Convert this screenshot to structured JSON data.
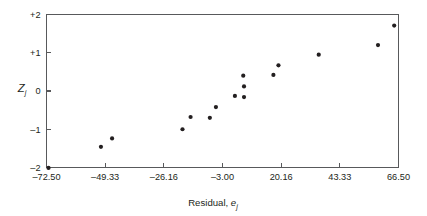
{
  "chart_data": {
    "type": "scatter",
    "title": "",
    "subtitle": "",
    "xlabel": "Residual, e",
    "xlabel_sub": "j",
    "ylabel": "Z",
    "ylabel_sub": "j",
    "xlim": [
      -72.5,
      66.5
    ],
    "ylim": [
      -2,
      2
    ],
    "grid": false,
    "legend": null,
    "xticks": [
      -72.5,
      -49.33,
      -26.16,
      -3.0,
      20.16,
      43.33,
      66.5
    ],
    "xtick_labels": [
      "–72.50",
      "–49.33",
      "–26.16",
      "–3.00",
      "20.16",
      "43.33",
      "66.50"
    ],
    "yticks": [
      2,
      1,
      0,
      -1,
      -2
    ],
    "ytick_labels": [
      "+2",
      "+1",
      "0",
      "–1",
      "–2"
    ],
    "marker": "filled-circle",
    "marker_color": "#231f20",
    "marker_size_px": 4.2,
    "points": [
      {
        "x": -71.7,
        "y": -2.01
      },
      {
        "x": -51.0,
        "y": -1.46
      },
      {
        "x": -46.6,
        "y": -1.24
      },
      {
        "x": -18.8,
        "y": -1.0
      },
      {
        "x": -15.6,
        "y": -0.68
      },
      {
        "x": -8.0,
        "y": -0.7
      },
      {
        "x": -5.6,
        "y": -0.42
      },
      {
        "x": 1.9,
        "y": -0.13
      },
      {
        "x": 5.5,
        "y": -0.16
      },
      {
        "x": 5.5,
        "y": 0.12
      },
      {
        "x": 5.2,
        "y": 0.4
      },
      {
        "x": 17.1,
        "y": 0.42
      },
      {
        "x": 19.1,
        "y": 0.67
      },
      {
        "x": 35.0,
        "y": 0.95
      },
      {
        "x": 58.4,
        "y": 1.2
      },
      {
        "x": 64.8,
        "y": 1.71
      }
    ]
  },
  "style": {
    "axis_color": "#58595b",
    "text_color": "#231f20",
    "background": "#ffffff"
  }
}
